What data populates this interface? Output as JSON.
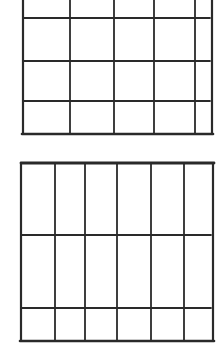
{
  "diagram": {
    "stroke_color": "#2a2a2a",
    "background": "#ffffff",
    "grids": [
      {
        "name": "top-grid",
        "columns": 5,
        "rows": 4,
        "vertical_lines_x": [
          23,
          70,
          114,
          154,
          195,
          212
        ],
        "horizontal_lines_y": [
          18,
          61,
          101
        ],
        "bottom_y": 134,
        "top_y": 0
      },
      {
        "name": "bottom-grid",
        "columns": 6,
        "rows": 3,
        "vertical_lines_x": [
          21,
          55,
          85,
          117,
          151,
          184,
          213
        ],
        "horizontal_lines_y": [
          235,
          308
        ],
        "top_y": 163,
        "bottom_y": 341
      }
    ]
  }
}
